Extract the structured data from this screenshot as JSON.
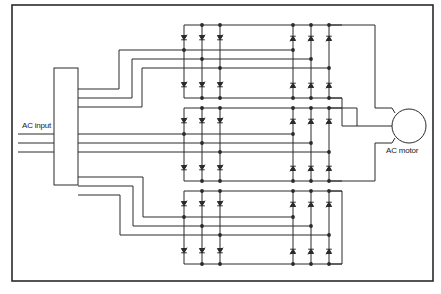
{
  "diagram": {
    "type": "cycloconverter schematic",
    "labels": {
      "input": "AC input",
      "motor": "AC motor"
    },
    "colors": {
      "line": "#2a2a2a",
      "background": "#ffffff"
    },
    "components": {
      "source": "AC input (3 lines)",
      "transformer": "multi-winding transformer block",
      "converter_groups": 3,
      "thyristors_per_group": 12,
      "load": "AC motor"
    }
  }
}
